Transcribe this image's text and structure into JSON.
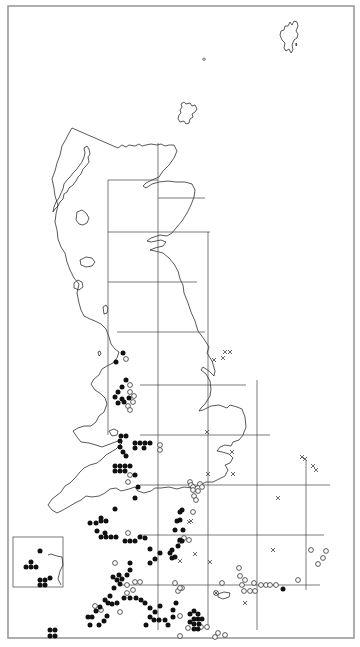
{
  "map": {
    "type": "species-distribution-map",
    "region": "Great Britain",
    "colors": {
      "filled": "#111111",
      "open_stroke": "#333333",
      "cross": "#444444",
      "coast": "#222222",
      "grid": "#444444",
      "frame": "#9a9a9a"
    },
    "frame": {
      "x": 8,
      "y": 6,
      "w": 346,
      "h": 632
    },
    "grid": {
      "vertical": [
        {
          "x": 108,
          "y1": 180,
          "y2": 435
        },
        {
          "x": 158,
          "y1": 143,
          "y2": 630
        },
        {
          "x": 208,
          "y1": 232,
          "y2": 630
        },
        {
          "x": 257,
          "y1": 380,
          "y2": 630
        },
        {
          "x": 306,
          "y1": 460,
          "y2": 590
        }
      ],
      "horizontal": [
        {
          "y": 180,
          "x1": 108,
          "x2": 158
        },
        {
          "y": 198,
          "x1": 158,
          "x2": 205
        },
        {
          "y": 232,
          "x1": 108,
          "x2": 210
        },
        {
          "y": 282,
          "x1": 108,
          "x2": 197
        },
        {
          "y": 332,
          "x1": 117,
          "x2": 205
        },
        {
          "y": 385,
          "x1": 140,
          "x2": 246
        },
        {
          "y": 435,
          "x1": 140,
          "x2": 270
        },
        {
          "y": 485,
          "x1": 140,
          "x2": 330
        },
        {
          "y": 535,
          "x1": 140,
          "x2": 324
        },
        {
          "y": 585,
          "x1": 120,
          "x2": 320
        }
      ]
    },
    "inset": {
      "x": 13,
      "y": 537,
      "w": 50,
      "h": 50
    },
    "legend_symbols": {
      "filled": "record-current",
      "open": "record-older",
      "cross": "record-introduced"
    },
    "filled_dots": [
      [
        123,
        353
      ],
      [
        116,
        362
      ],
      [
        126,
        380
      ],
      [
        122,
        387
      ],
      [
        118,
        392
      ],
      [
        122,
        399
      ],
      [
        115,
        397
      ],
      [
        118,
        403
      ],
      [
        124,
        402
      ],
      [
        129,
        398
      ],
      [
        121,
        436
      ],
      [
        126,
        436
      ],
      [
        120,
        441
      ],
      [
        120,
        447
      ],
      [
        123,
        452
      ],
      [
        126,
        456
      ],
      [
        135,
        443
      ],
      [
        140,
        443
      ],
      [
        145,
        443
      ],
      [
        150,
        443
      ],
      [
        135,
        448
      ],
      [
        144,
        448
      ],
      [
        115,
        466
      ],
      [
        120,
        466
      ],
      [
        125,
        466
      ],
      [
        130,
        466
      ],
      [
        115,
        471
      ],
      [
        120,
        471
      ],
      [
        125,
        471
      ],
      [
        135,
        475
      ],
      [
        138,
        487
      ],
      [
        135,
        498
      ],
      [
        115,
        509
      ],
      [
        101,
        521
      ],
      [
        106,
        521
      ],
      [
        90,
        523
      ],
      [
        96,
        523
      ],
      [
        101,
        518
      ],
      [
        105,
        533
      ],
      [
        97,
        531
      ],
      [
        101,
        537
      ],
      [
        106,
        537
      ],
      [
        111,
        537
      ],
      [
        116,
        537
      ],
      [
        125,
        541
      ],
      [
        130,
        541
      ],
      [
        135,
        541
      ],
      [
        140,
        537
      ],
      [
        145,
        538
      ],
      [
        150,
        549
      ],
      [
        160,
        553
      ],
      [
        170,
        553
      ],
      [
        172,
        558
      ],
      [
        175,
        557
      ],
      [
        172,
        550
      ],
      [
        178,
        546
      ],
      [
        182,
        541
      ],
      [
        130,
        570
      ],
      [
        130,
        563
      ],
      [
        127,
        575
      ],
      [
        122,
        579
      ],
      [
        117,
        580
      ],
      [
        119,
        575
      ],
      [
        155,
        559
      ],
      [
        150,
        563
      ],
      [
        114,
        588
      ],
      [
        110,
        596
      ],
      [
        105,
        600
      ],
      [
        100,
        607
      ],
      [
        96,
        611
      ],
      [
        92,
        617
      ],
      [
        88,
        617
      ],
      [
        90,
        625
      ],
      [
        99,
        625
      ],
      [
        104,
        621
      ],
      [
        107,
        616
      ],
      [
        112,
        604
      ],
      [
        117,
        603
      ],
      [
        108,
        603
      ],
      [
        124,
        598
      ],
      [
        130,
        598
      ],
      [
        136,
        598
      ],
      [
        141,
        600
      ],
      [
        145,
        603
      ],
      [
        150,
        608
      ],
      [
        155,
        612
      ],
      [
        150,
        617
      ],
      [
        154,
        620
      ],
      [
        159,
        620
      ],
      [
        146,
        625
      ],
      [
        180,
        520
      ],
      [
        183,
        530
      ],
      [
        175,
        530
      ],
      [
        180,
        540
      ],
      [
        180,
        512
      ],
      [
        182,
        510
      ],
      [
        177,
        521
      ],
      [
        176,
        603
      ],
      [
        173,
        610
      ],
      [
        173,
        617
      ],
      [
        168,
        625
      ],
      [
        165,
        620
      ],
      [
        190,
        614
      ],
      [
        194,
        611
      ],
      [
        198,
        614
      ],
      [
        194,
        619
      ],
      [
        198,
        619
      ],
      [
        202,
        619
      ],
      [
        190,
        622
      ],
      [
        194,
        624
      ],
      [
        199,
        624
      ],
      [
        194,
        629
      ],
      [
        198,
        629
      ],
      [
        113,
        577
      ],
      [
        120,
        584
      ],
      [
        160,
        606
      ],
      [
        283,
        589
      ],
      [
        40,
        551
      ],
      [
        31,
        562
      ],
      [
        26,
        567
      ],
      [
        31,
        567
      ],
      [
        36,
        567
      ],
      [
        40,
        580
      ],
      [
        45,
        580
      ],
      [
        50,
        578
      ],
      [
        40,
        585
      ],
      [
        45,
        585
      ],
      [
        50,
        630
      ],
      [
        55,
        630
      ],
      [
        50,
        636
      ],
      [
        55,
        636
      ]
    ],
    "open_dots": [
      [
        126,
        359
      ],
      [
        130,
        385
      ],
      [
        130,
        392
      ],
      [
        134,
        396
      ],
      [
        128,
        406
      ],
      [
        130,
        410
      ],
      [
        133,
        402
      ],
      [
        160,
        445
      ],
      [
        160,
        450
      ],
      [
        130,
        475
      ],
      [
        128,
        482
      ],
      [
        128,
        533
      ],
      [
        127,
        585
      ],
      [
        115,
        563
      ],
      [
        127,
        593
      ],
      [
        133,
        590
      ],
      [
        190,
        482
      ],
      [
        191,
        485
      ],
      [
        193,
        487
      ],
      [
        200,
        484
      ],
      [
        202,
        487
      ],
      [
        198,
        491
      ],
      [
        193,
        490
      ],
      [
        194,
        496
      ],
      [
        196,
        500
      ],
      [
        193,
        512
      ],
      [
        184,
        538
      ],
      [
        189,
        540
      ],
      [
        180,
        541
      ],
      [
        175,
        583
      ],
      [
        178,
        591
      ],
      [
        182,
        588
      ],
      [
        180,
        588
      ],
      [
        135,
        582
      ],
      [
        140,
        582
      ],
      [
        95,
        606
      ],
      [
        101,
        610
      ],
      [
        120,
        612
      ],
      [
        180,
        616
      ],
      [
        188,
        628
      ],
      [
        180,
        636
      ],
      [
        201,
        627
      ],
      [
        207,
        627
      ],
      [
        215,
        637
      ],
      [
        218,
        633
      ],
      [
        225,
        635
      ],
      [
        244,
        591
      ],
      [
        250,
        591
      ],
      [
        255,
        591
      ],
      [
        261,
        585
      ],
      [
        266,
        585
      ],
      [
        270,
        585
      ],
      [
        276,
        585
      ],
      [
        242,
        585
      ],
      [
        240,
        576
      ],
      [
        239,
        568
      ],
      [
        222,
        583
      ],
      [
        216,
        593
      ],
      [
        298,
        580
      ],
      [
        311,
        550
      ],
      [
        318,
        564
      ],
      [
        323,
        558
      ],
      [
        326,
        551
      ],
      [
        245,
        580
      ],
      [
        254,
        583
      ]
    ],
    "crosses": [
      [
        214,
        360
      ],
      [
        223,
        358
      ],
      [
        225,
        352
      ],
      [
        230,
        352
      ],
      [
        232,
        452
      ],
      [
        208,
        474
      ],
      [
        233,
        474
      ],
      [
        278,
        498
      ],
      [
        189,
        522
      ],
      [
        207,
        432
      ],
      [
        191,
        521
      ],
      [
        195,
        554
      ],
      [
        180,
        561
      ],
      [
        210,
        562
      ],
      [
        302,
        457
      ],
      [
        305,
        459
      ],
      [
        313,
        466
      ],
      [
        316,
        470
      ],
      [
        273,
        550
      ],
      [
        245,
        603
      ],
      [
        216,
        593
      ]
    ],
    "coastlines": {
      "shetland": "M292,25 l2,-4 l3,1 l1,4 l-2,5 l2,3 l-1,4 l-3,2 l-2,5 l1,5 l-2,3 l-2,-4 l-3,2 l-2,-3 l1,-5 l-3,-3 l-2,-5 l1,-4 l3,-1 l1,-4 l3,0 l2,-4 z M296,43 l1,2 l-1,1 z",
      "fair_isle": "M204,58 a1.2,1.2 0 1,0 0.1,0 z",
      "orkney": "M181,104 l3,-2 l2,2 l4,-1 l2,3 l3,-1 l2,4 l-2,3 l-3,2 l1,3 l-3,2 l-1,4 l-3,1 l-2,-3 l-4,1 l-2,-3 l1,-4 l2,-2 l-1,-3 l2,-3 z",
      "mainland": "M118,148 l4,-3 l4,2 l3,-2 l6,1 l4,-2 l3,2 l4,-1 l5,-1 l6,1 l4,-1 l4,2 l4,-1 l5,0 l3,6 l-3,7 l-5,7 l-6,6 l-4,6 l-7,3 l-6,3 l-3,3 l3,2 l6,-4 l7,-2 l9,-1 l8,1 l9,0 l7,2 l3,6 l-1,7 l-3,8 l-4,8 l-5,8 l-6,7 l-4,5 l-5,3 l-7,-1 l-9,3 l-4,3 l4,1 l10,-2 l5,2 l-3,4 l-8,2 l-5,2 l5,1 l8,2 l6,5 l5,6 l4,7 l2,8 l3,6 l1,8 l4,10 l3,9 l4,9 l3,10 l6,8 l5,8 l-2,6 l5,8 l3,10 l-1,5 l-5,-5 l-6,-4 l-2,3 l5,4 l4,7 l1,8 l-1,7 l-5,8 l-4,4 l-2,3 l4,-1 l8,-4 l8,-1 l8,3 l3,-3 l7,2 l5,2 l3,8 l1,10 l-3,8 l-4,5 l-6,2 l-2,4 l-6,-1 l-5,2 l-3,4 l5,1 l7,2 l4,4 l-3,5 l-5,2 l3,5 l-3,6 l-6,3 l-6,3 l-7,0 l-4,2 l-10,4 l-8,-1 l-7,2 l-8,-2 l-8,1 l-6,0 l-4,3 l-7,2 l-6,-2 l-3,-4 l-6,2 l-8,2 l-5,-3 l-6,1 l-5,4 l-6,3 l-7,1 l-6,-1 l-5,4 l-6,3 l-5,3 l-7,4 l-6,3 l-5,-3 l-4,-5 l4,-6 l4,-3 l5,-4 l4,-6 l5,-3 l5,-5 l5,-6 l4,-4 l6,-3 l7,-2 l5,-4 l4,-4 l5,-3 l5,-3 l6,-6 l-4,-2 l-8,3 l-8,3 l-6,-2 l-7,-2 l-8,-1 l-4,-5 l-4,-6 l5,-3 l6,-2 l7,0 l5,-4 l3,-6 l5,-4 l3,-8 l-2,-6 l-4,-4 l-6,-4 l-4,-6 l3,-5 l5,-4 l3,-6 l5,-3 l6,-3 l4,-5 l2,-6 l-4,-3 l-4,-5 l-2,-7 l-3,-8 l-5,-5 l-6,-3 l-5,-2 l-6,-3 l-3,-6 l-2,-7 l-2,-10 l2,-9 l-5,-6 l-4,-8 l-3,-8 l-2,-9 l-4,-6 l-3,-8 l-1,-9 l-2,-8 l1,-8 l2,-9 l-3,-9 l-1,-8 l-2,-9 l3,-8 l2,-8 l3,-8 l2,-9 l4,-7 l3,-6 l3,-5 z",
      "lewis": "M84,148 l3,-2 l2,3 l1,5 l-2,3 l1,5 l-3,4 l-3,3 l-2,5 l-3,3 l-2,4 l-3,4 l-4,3 l-2,4 l-3,2 l-1,5 l-3,3 l-2,4 l-3,3 l-2,3 l1,-5 l2,-5 l3,-4 l2,-5 l2,-4 l1,-5 l3,-4 l3,-3 l3,-4 l3,-3 l3,-4 l3,-4 l2,-5 l1,-4 z",
      "skye": "M77,212 l5,-2 l4,3 l3,5 l-2,5 l-4,2 l-4,-1 l-3,-4 z",
      "mull": "M80,260 l6,-3 l6,1 l3,4 l-3,4 l-6,1 l-5,-2 z",
      "islay": "M74,283 l4,-3 l4,2 l1,5 l-4,3 l-5,-2 z",
      "arran": "M103,307 l3,-2 l2,3 l-1,5 l-3,1 z",
      "man": "M98,352 l2,-1 l1,3 l-2,2 z",
      "anglesey": "M109,431 l5,-2 l4,2 l-1,4 l-5,1 z",
      "isle_of_wight": "M218,594 l6,-2 l6,1 l-1,4 l-6,2 l-5,-2 z",
      "inset_coast": "M48,555 l3,-1 l6,2 l5,1 l1,8 l-3,6 l-2,8 l3,6"
    }
  }
}
